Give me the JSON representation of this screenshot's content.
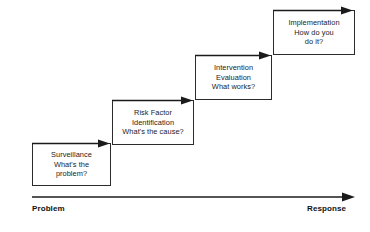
{
  "diagram": {
    "type": "staircase-flow",
    "title_visible": false,
    "line_color": "#1b1b1b",
    "text_color": "#1b1b1b",
    "background": "#ffffff",
    "stages": [
      {
        "id": "surveillance",
        "title": "Surveillance",
        "question": "What's the problem?",
        "text": "Surveillance\nWhat's the\nproblem?",
        "step": 1
      },
      {
        "id": "risk-factor-identification",
        "title": "Risk Factor Identification",
        "question": "What's the cause?",
        "text": "Risk Factor\nIdentification\nWhat's the cause?",
        "step": 2
      },
      {
        "id": "intervention-evaluation",
        "title": "Intervention Evaluation",
        "question": "What works?",
        "text": "Intervention\nEvaluation\nWhat works?",
        "step": 3
      },
      {
        "id": "implementation",
        "title": "Implementation",
        "question": "How do you do it?",
        "text": "Implementation\nHow do you\ndo it?",
        "step": 4
      }
    ],
    "axis": {
      "start_label": "Problem",
      "end_label": "Response",
      "direction": "left-to-right"
    }
  }
}
